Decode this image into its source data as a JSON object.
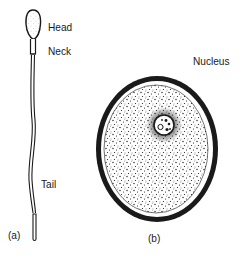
{
  "diagram": {
    "type": "biology-illustration",
    "panels": [
      {
        "id": "a",
        "caption": "(a)",
        "subject": "sperm-cell",
        "labels": {
          "head": "Head",
          "neck": "Neck",
          "tail": "Tail"
        }
      },
      {
        "id": "b",
        "caption": "(b)",
        "subject": "egg-cell",
        "labels": {
          "nucleus": "Nucleus"
        }
      }
    ],
    "colors": {
      "ink": "#1a1a1a",
      "background": "#ffffff"
    }
  }
}
